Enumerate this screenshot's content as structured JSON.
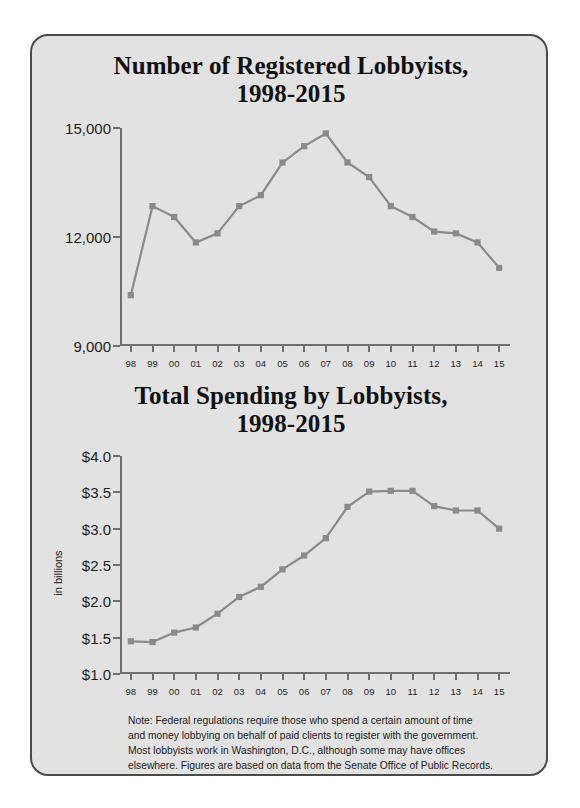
{
  "figure": {
    "background_color": "#e2e2e2",
    "border_color": "#4a4a4a",
    "series_color": "#8a8a8a"
  },
  "footnote": {
    "note_line1": "Note: Federal regulations require those who spend a certain amount of time",
    "note_line2": "and money lobbying on behalf of paid clients to register with the government.",
    "note_line3": "Most lobbyists work in Washington, D.C., although some may have offices",
    "note_line4": "elsewhere. Figures are based on data from the Senate Office of Public Records.",
    "source": "Source: OpenSecrets.org."
  },
  "chart_data": [
    {
      "type": "line",
      "id": "registered-lobbyists",
      "title": "Number of Registered Lobbyists,",
      "subtitle": "1998-2015",
      "xlabel": "",
      "ylabel": "",
      "grid": false,
      "legend": "none",
      "marker": "square",
      "categories": [
        "98",
        "99",
        "00",
        "01",
        "02",
        "03",
        "04",
        "05",
        "06",
        "07",
        "08",
        "09",
        "10",
        "11",
        "12",
        "13",
        "14",
        "15"
      ],
      "x": [
        1998,
        1999,
        2000,
        2001,
        2002,
        2003,
        2004,
        2005,
        2006,
        2007,
        2008,
        2009,
        2010,
        2011,
        2012,
        2013,
        2014,
        2015
      ],
      "values": [
        10400,
        12850,
        12550,
        11850,
        12100,
        12850,
        13150,
        14050,
        14500,
        14850,
        14050,
        13650,
        12850,
        12550,
        12150,
        12100,
        11850,
        11150
      ],
      "ylim": [
        9000,
        15000
      ],
      "yticks": [
        9000,
        12000,
        15000
      ],
      "ytick_labels": [
        "9,000",
        "12,000",
        "15,000"
      ]
    },
    {
      "type": "line",
      "id": "total-spending",
      "title": "Total Spending by Lobbyists,",
      "subtitle": "1998-2015",
      "xlabel": "",
      "ylabel": "in billions",
      "grid": false,
      "legend": "none",
      "marker": "square",
      "categories": [
        "98",
        "99",
        "00",
        "01",
        "02",
        "03",
        "04",
        "05",
        "06",
        "07",
        "08",
        "09",
        "10",
        "11",
        "12",
        "13",
        "14",
        "15"
      ],
      "x": [
        1998,
        1999,
        2000,
        2001,
        2002,
        2003,
        2004,
        2005,
        2006,
        2007,
        2008,
        2009,
        2010,
        2011,
        2012,
        2013,
        2014,
        2015
      ],
      "values": [
        1.45,
        1.44,
        1.57,
        1.64,
        1.83,
        2.06,
        2.2,
        2.44,
        2.63,
        2.87,
        3.3,
        3.51,
        3.52,
        3.52,
        3.31,
        3.25,
        3.25,
        3.0
      ],
      "ylim": [
        1.0,
        4.0
      ],
      "yticks": [
        1.0,
        1.5,
        2.0,
        2.5,
        3.0,
        3.5,
        4.0
      ],
      "ytick_labels": [
        "$1.0",
        "$1.5",
        "$2.0",
        "$2.5",
        "$3.0",
        "$3.5",
        "$4.0"
      ]
    }
  ]
}
